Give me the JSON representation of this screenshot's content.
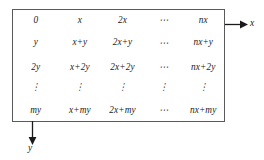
{
  "figure": {
    "type": "integer-lattice-grid",
    "axes": {
      "x": {
        "label": "x",
        "direction": "right",
        "arrow_icon": "arrow-right-icon"
      },
      "y": {
        "label": "y",
        "direction": "down",
        "arrow_icon": "arrow-down-icon"
      }
    },
    "grid": {
      "columns": 5,
      "rows": 5,
      "ellipsis_horizontal": "⋯",
      "ellipsis_vertical": "⋮",
      "cells": [
        [
          "0",
          "x",
          "2x",
          "⋯",
          "nx"
        ],
        [
          "y",
          "x+y",
          "2x+y",
          "⋯",
          "nx+y"
        ],
        [
          "2y",
          "x+2y",
          "2x+2y",
          "⋯",
          "nx+2y"
        ],
        [
          "⋮",
          "⋮",
          "⋮",
          "⋮",
          "⋮"
        ],
        [
          "my",
          "x+my",
          "2x+my",
          "⋯",
          "nx+my"
        ]
      ]
    },
    "colors": {
      "border": "#5a5a5a",
      "text": "#1b1b1b",
      "background": "#ffffff"
    }
  }
}
